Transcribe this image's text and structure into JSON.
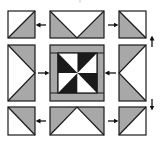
{
  "diagram": {
    "colors": {
      "grey": "#a8a8a8",
      "black": "#1a1a1a",
      "white": "#ffffff",
      "outline": "#1a1a1a"
    },
    "rows": [
      {
        "name": "top-row",
        "blocks": [
          {
            "name": "corner-top-left",
            "type": "half-square-triangle",
            "shading": "grey lower-right, white upper-left"
          },
          {
            "name": "flying-geese-top",
            "type": "flying-geese",
            "shading": "white center triangle pointing down, grey sides"
          },
          {
            "name": "corner-top-right",
            "type": "half-square-triangle",
            "shading": "grey lower-left, white upper-right"
          }
        ]
      },
      {
        "name": "middle-row",
        "blocks": [
          {
            "name": "flying-geese-left",
            "type": "flying-geese",
            "shading": "white center triangle pointing right, grey corners"
          },
          {
            "name": "center-pinwheel",
            "type": "framed-pinwheel",
            "shading": "black and white pinwheel with grey frame"
          },
          {
            "name": "flying-geese-right",
            "type": "flying-geese",
            "shading": "white center triangle pointing left, grey corners"
          }
        ]
      },
      {
        "name": "bottom-row",
        "blocks": [
          {
            "name": "corner-bottom-left",
            "type": "half-square-triangle",
            "shading": "grey upper-right, white lower-left"
          },
          {
            "name": "flying-geese-bottom",
            "type": "flying-geese",
            "shading": "white center triangle pointing up, grey sides"
          },
          {
            "name": "corner-bottom-right",
            "type": "half-square-triangle",
            "shading": "grey upper-left, white lower-right"
          }
        ]
      }
    ],
    "arrows": [
      {
        "name": "arrow-top-left",
        "direction": "left"
      },
      {
        "name": "arrow-top-right",
        "direction": "right"
      },
      {
        "name": "arrow-middle-left",
        "direction": "right"
      },
      {
        "name": "arrow-middle-right",
        "direction": "left"
      },
      {
        "name": "arrow-bottom-left",
        "direction": "left"
      },
      {
        "name": "arrow-bottom-right",
        "direction": "right"
      },
      {
        "name": "arrow-right-up",
        "direction": "up"
      },
      {
        "name": "arrow-right-down",
        "direction": "down"
      }
    ]
  }
}
